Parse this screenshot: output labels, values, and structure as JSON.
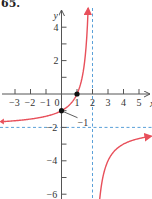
{
  "problem_number": "65.",
  "colors": {
    "curve": "#e8505b",
    "asymptote": "#5aa0d8",
    "axis": "#555555",
    "point": "#111111"
  },
  "chart_data": {
    "type": "line",
    "title": "",
    "function": "y = 2(x - 1)/(2 - x)",
    "xlabel": "x",
    "ylabel": "y",
    "xlim": [
      -3.9,
      5.8
    ],
    "ylim": [
      -6.2,
      5.5
    ],
    "x_ticks": [
      -3,
      -2,
      -1,
      0,
      1,
      2,
      3,
      4,
      5
    ],
    "x_tick_labels": [
      "−3",
      "−2",
      "−1",
      "0",
      "1",
      "2",
      "3",
      "4",
      "5"
    ],
    "y_ticks": [
      4,
      3,
      2,
      1,
      -1,
      -2,
      -3,
      -4,
      -5,
      -6
    ],
    "y_tick_labels": [
      {
        "value": 4,
        "label": "4"
      },
      {
        "value": 2,
        "label": "2"
      },
      {
        "value": -2,
        "label": "−2"
      },
      {
        "value": -4,
        "label": "−4"
      },
      {
        "value": -6,
        "label": "−6"
      }
    ],
    "asymptotes": [
      {
        "type": "vertical",
        "x": 2
      },
      {
        "type": "horizontal",
        "y": -2
      }
    ],
    "points": [
      {
        "x": 1,
        "y": 0
      },
      {
        "x": 0,
        "y": -1
      }
    ],
    "annotations": [
      {
        "text": "−1",
        "x": 0,
        "y": -1
      }
    ],
    "series": [
      {
        "name": "left branch",
        "x": [
          -3.7,
          -3,
          -2,
          -1,
          0,
          0.5,
          1,
          1.5,
          1.75,
          1.85
        ],
        "y": [
          -1.47,
          -1.6,
          -1.5,
          -1.33,
          -1,
          -0.67,
          0,
          2,
          6,
          9.3
        ]
      },
      {
        "name": "right branch",
        "x": [
          2.15,
          2.25,
          2.5,
          3,
          4,
          5,
          5.7
        ],
        "y": [
          -15.3,
          -10,
          -6,
          -4,
          -3,
          -2.67,
          -2.54
        ]
      }
    ],
    "grid": false,
    "legend": null
  }
}
